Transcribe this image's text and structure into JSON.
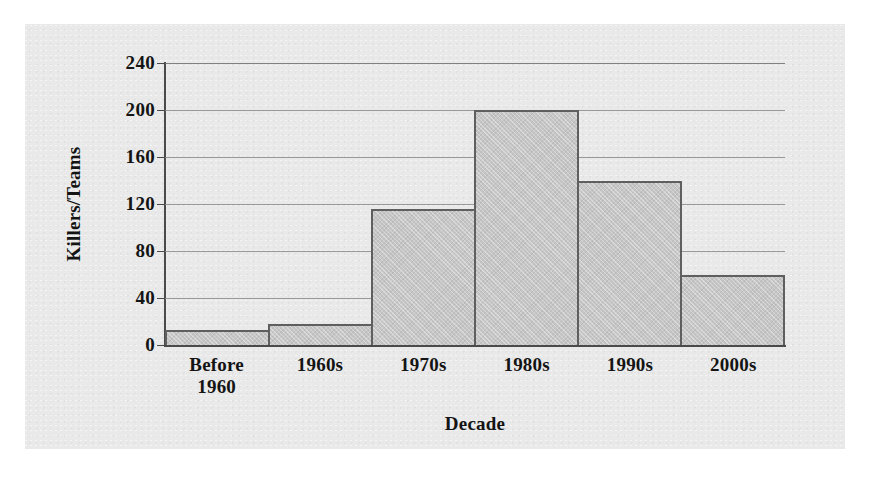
{
  "chart_data": {
    "type": "bar",
    "title": "",
    "xlabel": "Decade",
    "ylabel": "Killers/Teams",
    "categories": [
      "Before 1960",
      "1960s",
      "1970s",
      "1980s",
      "1990s",
      "2000s"
    ],
    "category_lines": [
      [
        "Before",
        "1960"
      ],
      [
        "1960s"
      ],
      [
        "1970s"
      ],
      [
        "1980s"
      ],
      [
        "1990s"
      ],
      [
        "2000s"
      ]
    ],
    "values": [
      13,
      18,
      116,
      200,
      140,
      60
    ],
    "ylim": [
      0,
      240
    ],
    "yticks": [
      0,
      40,
      80,
      120,
      160,
      200,
      240
    ],
    "ytick_labels": [
      "0",
      "40",
      "80",
      "120",
      "160",
      "200",
      "240"
    ],
    "grid": "horizontal",
    "legend": "none",
    "bar_gap": "none",
    "colors": {
      "bar_fill": "#c6c6c6",
      "bar_border": "#5f5f5f",
      "gridline": "#8a8a8a",
      "axis": "#4a4a4a",
      "figure_background": "#e9e9e9",
      "page_background": "#ffffff",
      "text": "#141414"
    }
  },
  "page": {
    "residue_text": ""
  }
}
